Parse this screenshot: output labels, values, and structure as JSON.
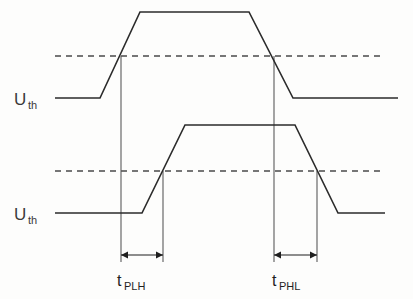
{
  "figure": {
    "type": "timing-diagram",
    "background_color": "#fdfdfc",
    "line_color": "#2b2b2b",
    "threshold_color": "#4a4a4a",
    "reference_color": "#5a5a5a"
  },
  "labels": {
    "threshold_input": {
      "symbol": "U",
      "subscript": "th"
    },
    "threshold_output": {
      "symbol": "U",
      "subscript": "th"
    },
    "delay_low_to_high": {
      "symbol": "t",
      "subscript": "PLH"
    },
    "delay_high_to_low": {
      "symbol": "t",
      "subscript": "PHL"
    }
  },
  "chart_data": {
    "type": "line",
    "title": "",
    "xlabel": "",
    "ylabel": "",
    "grid": false,
    "legend_position": "none",
    "xlim": [
      0,
      413
    ],
    "ylim": [
      0,
      299
    ],
    "series": [
      {
        "name": "input-waveform",
        "description": "Upper trapezoidal input signal",
        "low_level_y": 98,
        "high_level_y": 12,
        "points": [
          [
            55,
            98
          ],
          [
            100,
            98
          ],
          [
            140,
            12
          ],
          [
            249,
            12
          ],
          [
            293,
            98
          ],
          [
            398,
            98
          ]
        ],
        "threshold_crossings": [
          {
            "edge": "rising",
            "x": 121,
            "y": 56
          },
          {
            "edge": "falling",
            "x": 274,
            "y": 56
          }
        ]
      },
      {
        "name": "output-waveform",
        "description": "Lower trapezoidal output signal, delayed relative to input",
        "low_level_y": 213,
        "high_level_y": 125,
        "points": [
          [
            55,
            213
          ],
          [
            142,
            213
          ],
          [
            185,
            125
          ],
          [
            295,
            125
          ],
          [
            338,
            213
          ],
          [
            385,
            213
          ]
        ],
        "threshold_crossings": [
          {
            "edge": "rising",
            "x": 163,
            "y": 171
          },
          {
            "edge": "falling",
            "x": 317,
            "y": 171
          }
        ]
      }
    ],
    "threshold_lines": [
      {
        "name": "input-threshold",
        "y": 56,
        "x_start": 55,
        "x_end": 385,
        "style": "dashed"
      },
      {
        "name": "output-threshold",
        "y": 171,
        "x_start": 55,
        "x_end": 385,
        "style": "dashed"
      }
    ],
    "reference_lines": [
      {
        "name": "input-rise-reference",
        "x": 121,
        "y_start": 56,
        "y_end": 262
      },
      {
        "name": "output-rise-reference",
        "x": 163,
        "y_start": 171,
        "y_end": 262
      },
      {
        "name": "input-fall-reference",
        "x": 274,
        "y_start": 56,
        "y_end": 262
      },
      {
        "name": "output-fall-reference",
        "x": 317,
        "y_start": 171,
        "y_end": 262
      }
    ],
    "measurements": [
      {
        "name": "t-PLH",
        "label": "t",
        "sublabel": "PLH",
        "x_start": 121,
        "x_end": 163,
        "y": 255,
        "meaning": "Propagation delay, output low to high"
      },
      {
        "name": "t-PHL",
        "label": "t",
        "sublabel": "PHL",
        "x_start": 274,
        "x_end": 317,
        "y": 255,
        "meaning": "Propagation delay, output high to low"
      }
    ]
  }
}
